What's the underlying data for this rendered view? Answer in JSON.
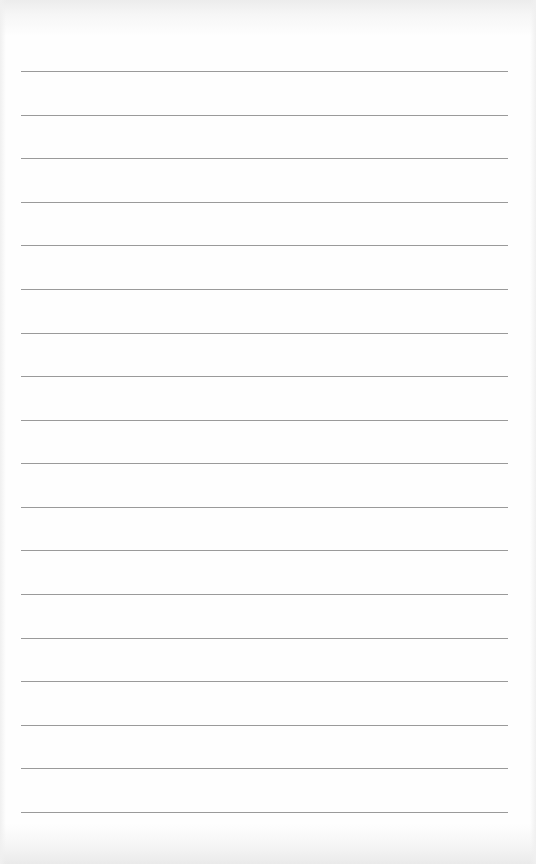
{
  "page": {
    "type": "lined-paper",
    "background_color": "#fefefe",
    "rule_color": "#9a9a9a",
    "rule_count": 18,
    "rule_positions_y": [
      71,
      118,
      160,
      203,
      247,
      290,
      333,
      359,
      401,
      446,
      489,
      533,
      576,
      620,
      663,
      707,
      770,
      812
    ],
    "rule_left_x": 21,
    "rule_right_x": 508
  }
}
